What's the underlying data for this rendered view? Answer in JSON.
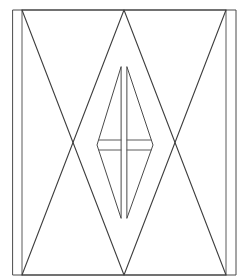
{
  "diagram": {
    "title": "",
    "colors": {
      "background": "#ffffff",
      "stroke": "#4a4a4a",
      "stroke_light": "#7a7a7a"
    },
    "frame": {
      "x": 13,
      "y": 10,
      "width": 223,
      "height": 265
    },
    "inner_rails": [
      {
        "x1": 22,
        "y1": 10,
        "x2": 22,
        "y2": 275
      },
      {
        "x1": 226,
        "y1": 10,
        "x2": 226,
        "y2": 275
      }
    ],
    "triangles": [
      {
        "name": "down-triangle",
        "points": "22,10 226,10 124,275"
      },
      {
        "name": "up-triangle",
        "points": "22,275 226,275 124,10"
      }
    ],
    "diamond_halves": [
      {
        "name": "left-half",
        "points": "121,67 97,145 121,218"
      },
      {
        "name": "right-half",
        "points": "127,67 153,145 127,218"
      }
    ],
    "crossbars": [
      {
        "x1": 99,
        "y1": 140,
        "x2": 121,
        "y2": 140
      },
      {
        "x1": 99,
        "y1": 150,
        "x2": 121,
        "y2": 150
      },
      {
        "x1": 127,
        "y1": 140,
        "x2": 151,
        "y2": 140
      },
      {
        "x1": 127,
        "y1": 150,
        "x2": 151,
        "y2": 150
      }
    ]
  }
}
